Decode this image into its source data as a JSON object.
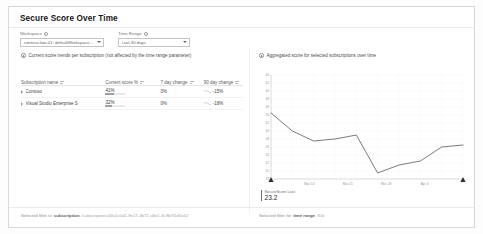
{
  "panel": {
    "title": "Secure Score Over Time"
  },
  "filters": {
    "workspace": {
      "label": "Workspace",
      "value": "contoso-law-01; defaultWorkspace-7a3c-eus; securitycenter-ws",
      "info_icon": "info-icon",
      "caret_icon": "chevron-down-icon"
    },
    "time_range": {
      "label": "Time Range",
      "value": "Last 30 days",
      "info_icon": "info-icon",
      "caret_icon": "chevron-down-icon"
    }
  },
  "captions": {
    "left": "Current score trends per subscription (not affected by the time range parameter)",
    "right": "Aggregated score for selected subscriptions over time",
    "icon": "info-circle-icon"
  },
  "table": {
    "columns": [
      {
        "label": "Subscription name",
        "sort_icon": "sort-icon"
      },
      {
        "label": "Current score %",
        "sort_icon": "sort-icon"
      },
      {
        "label": "7 day change",
        "sort_icon": "sort-icon"
      },
      {
        "label": "90 day change",
        "sort_icon": "sort-icon"
      }
    ],
    "rows": [
      {
        "expand_icon": "chevron-right-icon",
        "name": "Contoso",
        "score": "41%",
        "score_pct": 41,
        "change_7day": "0%",
        "change_90day": "-15%",
        "trend_icon": "sparkline-down-icon"
      },
      {
        "expand_icon": "chevron-right-icon",
        "name": "Visual Studio Enterprise S",
        "score": "32%",
        "score_pct": 32,
        "change_7day": "0%",
        "change_90day": "-18%",
        "trend_icon": "sparkline-down-icon"
      }
    ]
  },
  "chart_data": {
    "type": "line",
    "title": "",
    "xlabel": "",
    "ylabel": "",
    "x": [
      "Mar 7",
      "Mar 10",
      "Mar 14",
      "Mar 17",
      "Mar 21",
      "Mar 24",
      "Mar 28",
      "Mar 31",
      "Apr 4",
      "Apr 7"
    ],
    "tick_labels": [
      "Mar 14",
      "Mar 21",
      "Mar 28",
      "Apr 4"
    ],
    "values": [
      34.5,
      30.0,
      27.5,
      28.0,
      29.0,
      19.5,
      21.5,
      22.5,
      26.0,
      26.5
    ],
    "ylim": [
      18,
      44
    ],
    "y_ticks": [
      18,
      20,
      22,
      24,
      26,
      28,
      30,
      32,
      34,
      36,
      38,
      40,
      42,
      44
    ],
    "grid": true,
    "legend": "none",
    "line_color": "#6b6b6b",
    "annotation": {
      "label": "SecureScore Last",
      "value": "23.2"
    },
    "markers": [
      "range-start-marker",
      "range-end-marker"
    ]
  },
  "footer": {
    "left": {
      "prefix": "Selected filter to",
      "key": "subscription",
      "value": "/subscriptions/4fa1c0d2-9e17-4b72-a8e1-3c9b7f1d5e42"
    },
    "right": {
      "prefix": "Selected filter for",
      "key": "time range",
      "value": "30d"
    }
  }
}
